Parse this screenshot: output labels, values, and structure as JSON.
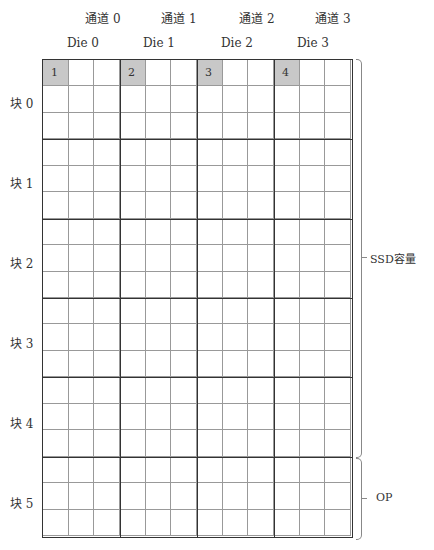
{
  "channels": [
    "通道 0",
    "通道 1",
    "通道 2",
    "通道 3"
  ],
  "dies": [
    "Die 0",
    "Die 1",
    "Die 2",
    "Die 3"
  ],
  "blocks": [
    "块 0",
    "块 1",
    "块 2",
    "块 3",
    "块 4",
    "块 5"
  ],
  "highlighted_pages": [
    "1",
    "2",
    "3",
    "4"
  ],
  "brackets": {
    "ssd": "SSD容量",
    "op": "OP"
  },
  "colors": {
    "highlight": "#c8c8c8",
    "grid_line": "#333333"
  }
}
